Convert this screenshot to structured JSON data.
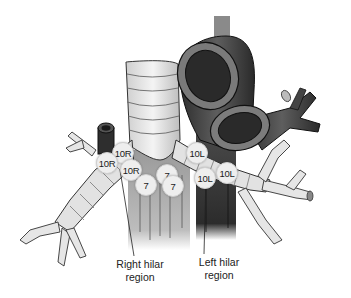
{
  "figure": {
    "type": "anatomical-illustration"
  },
  "node_stations": [
    {
      "id": "10R-a",
      "label": "10R",
      "x": 112,
      "y": 142
    },
    {
      "id": "10R-b",
      "label": "10R",
      "x": 96,
      "y": 152
    },
    {
      "id": "10R-c",
      "label": "10R",
      "x": 120,
      "y": 159
    },
    {
      "id": "7-a",
      "label": "7",
      "x": 156,
      "y": 164
    },
    {
      "id": "7-b",
      "label": "7",
      "x": 135,
      "y": 174
    },
    {
      "id": "7-c",
      "label": "7",
      "x": 162,
      "y": 175
    },
    {
      "id": "10L-a",
      "label": "10L",
      "x": 186,
      "y": 142
    },
    {
      "id": "10L-b",
      "label": "10L",
      "x": 194,
      "y": 167
    },
    {
      "id": "10L-c",
      "label": "10L",
      "x": 216,
      "y": 162
    }
  ],
  "captions": {
    "right_hilar_line1": "Right hilar",
    "right_hilar_line2": "region",
    "left_hilar_line1": "Left hilar",
    "left_hilar_line2": "region"
  },
  "colors": {
    "airway": "#e4e4e4",
    "vessel_dark": "#3c3c3c",
    "vessel_mid": "#6a6a6a",
    "outline": "#2a2a2a",
    "label_bg": "#eeeeee"
  }
}
